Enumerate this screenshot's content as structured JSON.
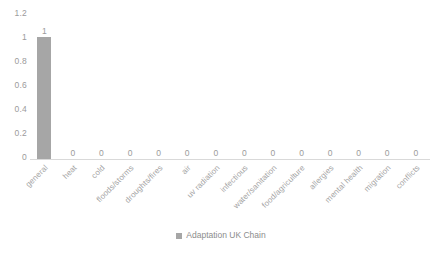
{
  "chart_data": {
    "type": "bar",
    "title": "",
    "subtitle": "",
    "xlabel": "",
    "ylabel": "",
    "ylim": [
      0,
      1.2
    ],
    "ytick_labels": [
      "1.2",
      "1",
      "0.8",
      "0.6",
      "0.4",
      "0.2",
      "0"
    ],
    "ytick_values": [
      1.2,
      1,
      0.8,
      0.6,
      0.4,
      0.2,
      0
    ],
    "grid": false,
    "legend_position": "bottom",
    "categories": [
      "general",
      "heat",
      "cold",
      "floods/storms",
      "droughts/fires",
      "air",
      "uv radiation",
      "infectious",
      "water/sanitation",
      "food/agriculture",
      "allergies",
      "mental health",
      "migration",
      "conflicts"
    ],
    "values": [
      1,
      0,
      0,
      0,
      0,
      0,
      0,
      0,
      0,
      0,
      0,
      0,
      0,
      0
    ],
    "data_labels": [
      "1",
      "0",
      "0",
      "0",
      "0",
      "0",
      "0",
      "0",
      "0",
      "0",
      "0",
      "0",
      "0",
      "0"
    ],
    "series": [
      {
        "name": "Adaptation UK Chain",
        "color": "#a6a6a6",
        "values": [
          1,
          0,
          0,
          0,
          0,
          0,
          0,
          0,
          0,
          0,
          0,
          0,
          0,
          0
        ]
      }
    ]
  },
  "legend": {
    "entries": [
      {
        "label": "Adaptation UK Chain",
        "color": "#a6a6a6"
      }
    ]
  },
  "colors": {
    "bar": "#a6a6a6",
    "axis_line": "#d9d9d9",
    "tick_text": "#9b9b9b",
    "category_text": "#a3a3a3",
    "legend_text": "#8c8c8c",
    "background": "#ffffff"
  }
}
